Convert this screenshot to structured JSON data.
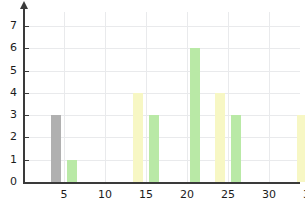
{
  "chart_data": {
    "type": "bar",
    "title": "",
    "subtitle": "",
    "xlabel": "",
    "ylabel": "",
    "xlim": [
      2,
      38
    ],
    "ylim": [
      0,
      7.4
    ],
    "grid": true,
    "legend": "none",
    "y_ticks": [
      0,
      1,
      2,
      3,
      4,
      5,
      6,
      7
    ],
    "y_tick_labels": [
      "0",
      "1",
      "2",
      "3",
      "4",
      "5",
      "6",
      "7"
    ],
    "x_ticks": [
      5,
      10,
      15,
      20,
      25,
      30,
      35
    ],
    "x_tick_labels": [
      "5",
      "10",
      "15",
      "20",
      "25",
      "30",
      "35"
    ],
    "bar_width": 2,
    "colors": {
      "gray": "#b0b0b0",
      "yellow": "#f7f7c4",
      "green": "#b9e9a6",
      "axis": "#3a3a3a",
      "grid": "#e9eaec",
      "background": "#ffffff",
      "tick_text": "#1c1c1c"
    },
    "bars": [
      {
        "x": 4,
        "value": 3,
        "color": "gray"
      },
      {
        "x": 6,
        "value": 1,
        "color": "green"
      },
      {
        "x": 14,
        "value": 4,
        "color": "yellow"
      },
      {
        "x": 16,
        "value": 3,
        "color": "green"
      },
      {
        "x": 21,
        "value": 6,
        "color": "green"
      },
      {
        "x": 24,
        "value": 4,
        "color": "yellow"
      },
      {
        "x": 26,
        "value": 3,
        "color": "green"
      },
      {
        "x": 34,
        "value": 3,
        "color": "yellow"
      },
      {
        "x": 36,
        "value": 1,
        "color": "green"
      }
    ]
  },
  "geometry": {
    "origin_x": 23,
    "origin_y": 182,
    "px_per_x_unit": 8.2,
    "px_per_y_unit": 22.3,
    "axis_top_y": 8,
    "axis_right_x": 300
  }
}
